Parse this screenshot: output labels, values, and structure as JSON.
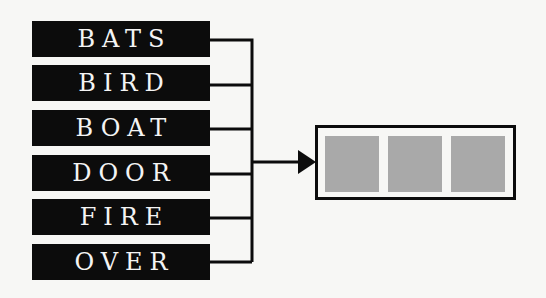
{
  "diagram": {
    "words": [
      "BATS",
      "BIRD",
      "BOAT",
      "DOOR",
      "FIRE",
      "OVER"
    ],
    "target": {
      "slots": 3,
      "slot_color": "#a9a9a9"
    },
    "colors": {
      "word_bg": "#0c0c0c",
      "word_text": "#f4f4f4",
      "line": "#0c0c0c",
      "background": "#f7f7f5"
    }
  }
}
